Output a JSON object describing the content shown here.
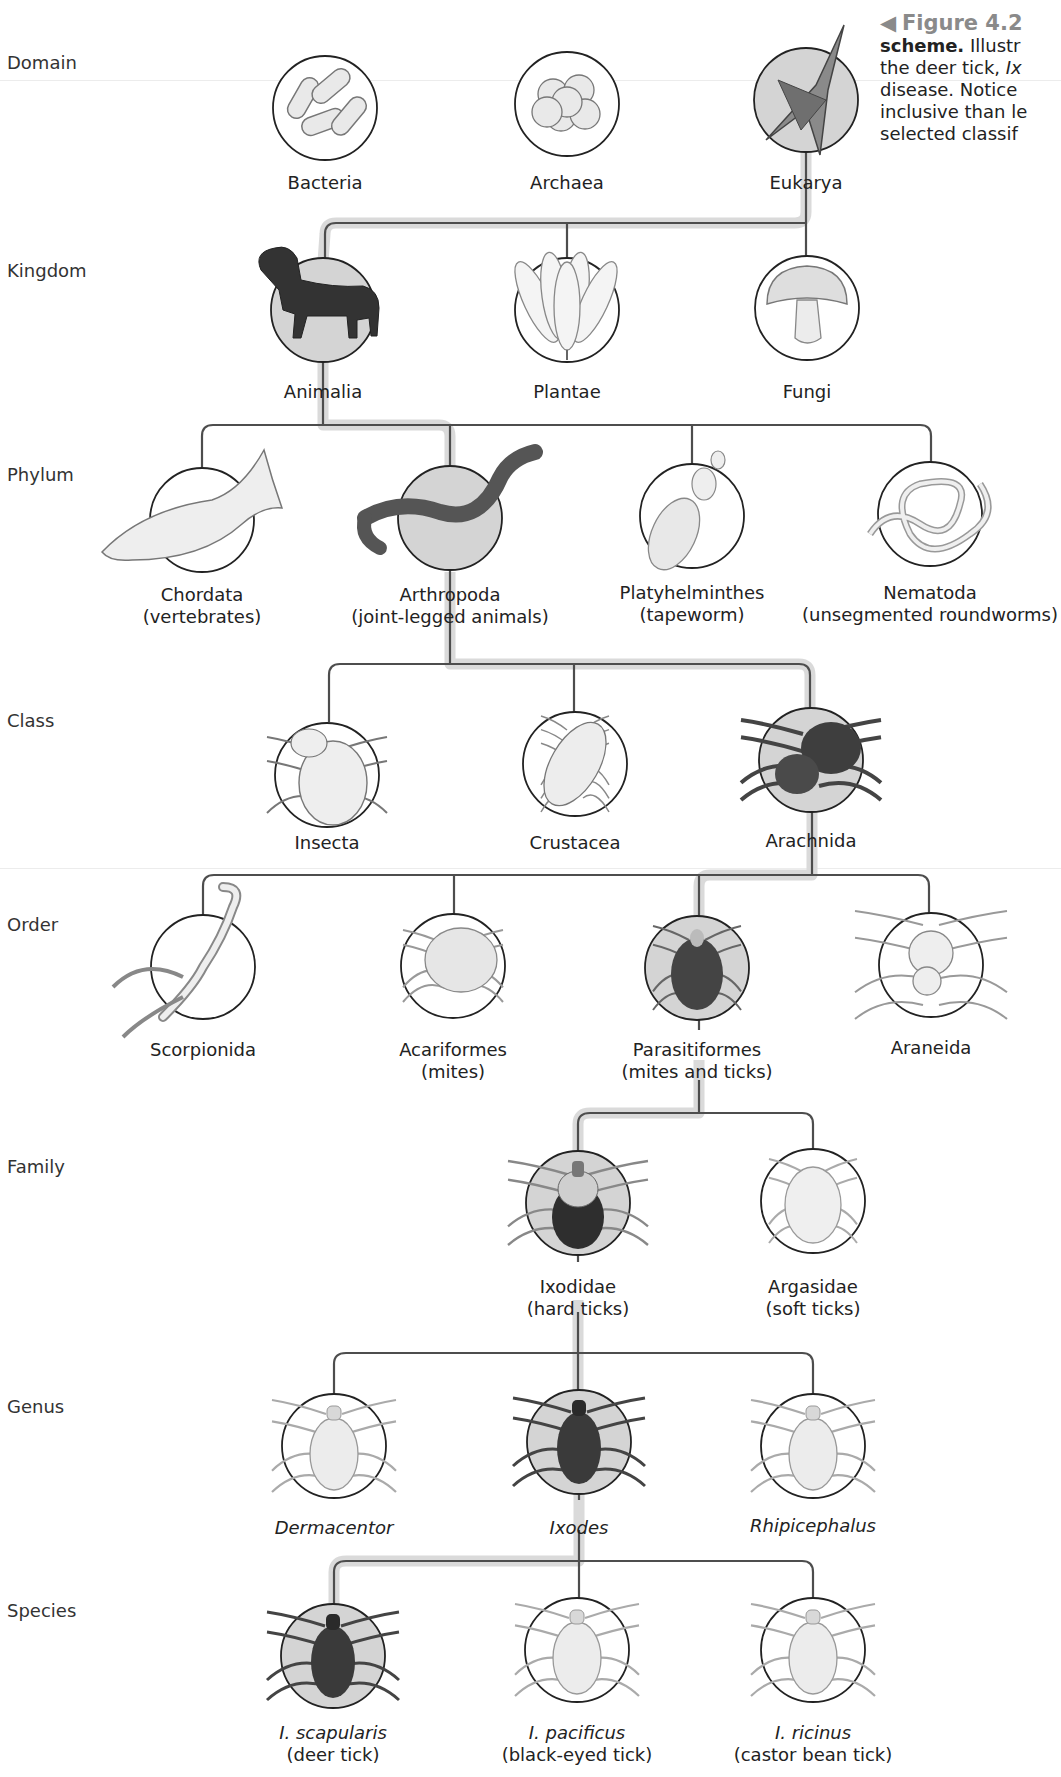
{
  "caption": {
    "figure_marker": "◀",
    "figure_number": "Figure 4.2",
    "lines": [
      {
        "bold": "scheme.",
        "rest": " Illustr"
      },
      {
        "text": "the deer tick, ",
        "italic": "Ix"
      },
      {
        "text": "disease. Notice"
      },
      {
        "text": "inclusive than le"
      },
      {
        "text": "selected classif"
      }
    ]
  },
  "colors": {
    "line": "#4d4d4d",
    "highlight_band": "#dadada",
    "highlight_fill": "#d4d4d4",
    "circle_stroke": "#222222",
    "caption_figure": "#8a8a8a"
  },
  "ranks": [
    {
      "label": "Domain",
      "y": 62
    },
    {
      "label": "Kingdom",
      "y": 270
    },
    {
      "label": "Phylum",
      "y": 474
    },
    {
      "label": "Class",
      "y": 720
    },
    {
      "label": "Order",
      "y": 924
    },
    {
      "label": "Family",
      "y": 1166
    },
    {
      "label": "Genus",
      "y": 1406
    },
    {
      "label": "Species",
      "y": 1610
    }
  ],
  "nodes": {
    "domain": [
      {
        "name": "Bacteria",
        "icon": "bacteria-icon",
        "cx": 325,
        "cy": 108,
        "highlight": false,
        "label_y": 172
      },
      {
        "name": "Archaea",
        "icon": "archaea-icon",
        "cx": 567,
        "cy": 104,
        "highlight": false,
        "label_y": 172
      },
      {
        "name": "Eukarya",
        "icon": "protist-icon",
        "cx": 806,
        "cy": 100,
        "highlight": true,
        "label_y": 172
      }
    ],
    "kingdom": [
      {
        "name": "Animalia",
        "icon": "dog-icon",
        "cx": 323,
        "cy": 310,
        "highlight": true,
        "label_y": 381
      },
      {
        "name": "Plantae",
        "icon": "flower-icon",
        "cx": 567,
        "cy": 310,
        "highlight": false,
        "label_y": 381
      },
      {
        "name": "Fungi",
        "icon": "mushroom-icon",
        "cx": 807,
        "cy": 308,
        "highlight": false,
        "label_y": 381
      }
    ],
    "phylum": [
      {
        "name": "Chordata",
        "common": "(vertebrates)",
        "icon": "fish-icon",
        "cx": 202,
        "cy": 520,
        "highlight": false,
        "label_y": 584
      },
      {
        "name": "Arthropoda",
        "common": "(joint-legged animals)",
        "icon": "millipede-icon",
        "cx": 450,
        "cy": 518,
        "highlight": true,
        "label_y": 584
      },
      {
        "name": "Platyhelminthes",
        "common": "(tapeworm)",
        "icon": "tapeworm-icon",
        "cx": 692,
        "cy": 516,
        "highlight": false,
        "label_y": 582
      },
      {
        "name": "Nematoda",
        "common": "(unsegmented roundworms)",
        "icon": "roundworm-icon",
        "cx": 930,
        "cy": 514,
        "highlight": false,
        "label_y": 582
      }
    ],
    "class": [
      {
        "name": "Insecta",
        "icon": "beetle-icon",
        "cx": 327,
        "cy": 775,
        "highlight": false,
        "label_y": 832
      },
      {
        "name": "Crustacea",
        "icon": "isopod-icon",
        "cx": 575,
        "cy": 764,
        "highlight": false,
        "label_y": 832
      },
      {
        "name": "Arachnida",
        "icon": "tarantula-icon",
        "cx": 811,
        "cy": 760,
        "highlight": true,
        "label_y": 830
      }
    ],
    "order": [
      {
        "name": "Scorpionida",
        "icon": "scorpion-icon",
        "cx": 203,
        "cy": 967,
        "highlight": false,
        "label_y": 1039
      },
      {
        "name": "Acariformes",
        "common": "(mites)",
        "icon": "mite-icon",
        "cx": 453,
        "cy": 966,
        "highlight": false,
        "label_y": 1039
      },
      {
        "name": "Parasitiformes",
        "common": "(mites and ticks)",
        "icon": "mite-dark-icon",
        "cx": 697,
        "cy": 968,
        "highlight": true,
        "label_y": 1039
      },
      {
        "name": "Araneida",
        "icon": "spider-icon",
        "cx": 931,
        "cy": 965,
        "highlight": false,
        "label_y": 1037
      }
    ],
    "family": [
      {
        "name": "Ixodidae",
        "common": "(hard ticks)",
        "icon": "hard-tick-icon",
        "cx": 578,
        "cy": 1203,
        "highlight": true,
        "label_y": 1276
      },
      {
        "name": "Argasidae",
        "common": "(soft ticks)",
        "icon": "soft-tick-icon",
        "cx": 813,
        "cy": 1201,
        "highlight": false,
        "label_y": 1276
      }
    ],
    "genus": [
      {
        "name": "Dermacentor",
        "italic": true,
        "icon": "tick-icon",
        "cx": 334,
        "cy": 1446,
        "highlight": false,
        "label_y": 1517
      },
      {
        "name": "Ixodes",
        "italic": true,
        "icon": "tick-dark-icon",
        "cx": 579,
        "cy": 1442,
        "highlight": true,
        "label_y": 1517
      },
      {
        "name": "Rhipicephalus",
        "italic": true,
        "icon": "tick-icon",
        "cx": 813,
        "cy": 1446,
        "highlight": false,
        "label_y": 1515
      }
    ],
    "species": [
      {
        "name": "I. scapularis",
        "italic": true,
        "common": "(deer tick)",
        "icon": "tick-dark-icon",
        "cx": 333,
        "cy": 1656,
        "highlight": true,
        "label_y": 1722
      },
      {
        "name": "I. pacificus",
        "italic": true,
        "common": "(black-eyed tick)",
        "icon": "tick-icon",
        "cx": 577,
        "cy": 1650,
        "highlight": false,
        "label_y": 1722
      },
      {
        "name": "I. ricinus",
        "italic": true,
        "common": "(castor bean tick)",
        "icon": "tick-icon",
        "cx": 813,
        "cy": 1650,
        "highlight": false,
        "label_y": 1722
      }
    ]
  },
  "highlighted_path": [
    "Eukarya",
    "Animalia",
    "Arthropoda",
    "Arachnida",
    "Parasitiformes",
    "Ixodidae",
    "Ixodes",
    "I. scapularis"
  ]
}
